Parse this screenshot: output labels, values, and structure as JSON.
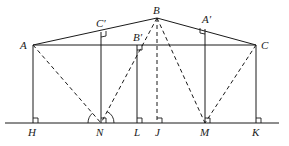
{
  "diagram": {
    "type": "geometry",
    "points": {
      "A": {
        "label": "A",
        "x": 33,
        "y": 45
      },
      "B": {
        "label": "B",
        "x": 157,
        "y": 18
      },
      "C": {
        "label": "C",
        "x": 256,
        "y": 45
      },
      "C_prime": {
        "label": "C′",
        "x": 101,
        "y": 32
      },
      "B_prime": {
        "label": "B′",
        "x": 137,
        "y": 45
      },
      "A_prime": {
        "label": "A′",
        "x": 205,
        "y": 29
      },
      "H": {
        "label": "H",
        "x": 33,
        "y": 123
      },
      "N": {
        "label": "N",
        "x": 101,
        "y": 123
      },
      "L": {
        "label": "L",
        "x": 137,
        "y": 123
      },
      "J": {
        "label": "J",
        "x": 157,
        "y": 123
      },
      "M": {
        "label": "M",
        "x": 205,
        "y": 123
      },
      "K": {
        "label": "K",
        "x": 256,
        "y": 123
      }
    },
    "solid_segments": [
      "AB",
      "BC",
      "AC",
      "AH",
      "C′N",
      "B′L",
      "A′M",
      "CK",
      "ground"
    ],
    "dashed_segments": [
      "AN",
      "BN",
      "BJ",
      "BM",
      "CM"
    ],
    "right_angle_marks": [
      "C′",
      "B′",
      "A′",
      "H",
      "N",
      "L",
      "J",
      "M",
      "K"
    ],
    "angle_arcs": [
      "left-of-N",
      "right-of-N"
    ]
  }
}
